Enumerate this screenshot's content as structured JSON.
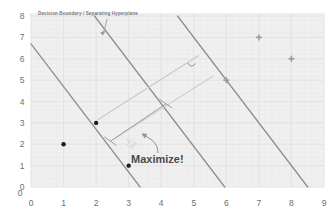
{
  "figure": {
    "kind": "svm-margin-diagram",
    "background": "#ffffff",
    "plot_background": "#f0f0f0",
    "grid_color": "#e2e2e2",
    "line_color": "#8a8a8a",
    "guide_color": "#c9c9c9",
    "dot_color": "#1c1c1c",
    "cross_color": "#9a9a9a",
    "text_color": "#7a7a7a"
  },
  "annotations": {
    "boundary_label": "Decision Boundary / Separating Hyperplane",
    "maximize_label": "Maximize!",
    "margin_formula_numerator": "2",
    "margin_formula_denominator": "||w||"
  },
  "chart_data": {
    "type": "scatter",
    "title": "",
    "xlabel": "",
    "ylabel": "",
    "xlim": [
      0,
      9
    ],
    "ylim": [
      0,
      8
    ],
    "grid": true,
    "xticks": [
      "0",
      "1",
      "2",
      "3",
      "4",
      "5",
      "6",
      "7",
      "8",
      "9"
    ],
    "yticks": [
      "0",
      "1",
      "2",
      "3",
      "4",
      "5",
      "6",
      "7",
      "8"
    ],
    "legend": "none",
    "series": [
      {
        "name": "class-negative-dots",
        "marker": "dot",
        "color": "#1c1c1c",
        "points": [
          {
            "x": 1,
            "y": 2,
            "support_vector": false
          },
          {
            "x": 2,
            "y": 3,
            "support_vector": true
          },
          {
            "x": 3,
            "y": 1,
            "support_vector": true
          }
        ]
      },
      {
        "name": "class-positive-crosses",
        "marker": "cross",
        "color": "#9a9a9a",
        "points": [
          {
            "x": 6,
            "y": 5,
            "support_vector": true
          },
          {
            "x": 7,
            "y": 7,
            "support_vector": false
          },
          {
            "x": 8,
            "y": 6,
            "support_vector": false
          }
        ]
      }
    ],
    "lines": [
      {
        "name": "left-margin-boundary",
        "slope": -2,
        "intercept": 6.7,
        "style": "solid",
        "color": "#8a8a8a"
      },
      {
        "name": "decision-boundary",
        "slope": -2,
        "intercept": 11.9,
        "style": "solid",
        "color": "#8a8a8a"
      },
      {
        "name": "right-margin-boundary",
        "slope": -2,
        "intercept": 17.0,
        "style": "solid",
        "color": "#8a8a8a"
      }
    ],
    "margin_guides": [
      {
        "name": "margin-guide-upper",
        "from": {
          "x": 2.05,
          "y": 3.15
        },
        "to": {
          "x": 5.15,
          "y": 6.15
        }
      },
      {
        "name": "margin-guide-lower",
        "from": {
          "x": 2.55,
          "y": 2.25
        },
        "to": {
          "x": 5.6,
          "y": 5.2
        }
      }
    ]
  },
  "axes": {
    "x_tick_labels": [
      "0",
      "1",
      "2",
      "3",
      "4",
      "5",
      "6",
      "7",
      "8",
      "9"
    ],
    "y_tick_labels": [
      "0",
      "1",
      "2",
      "3",
      "4",
      "5",
      "6",
      "7",
      "8"
    ],
    "origin_label": "0"
  }
}
